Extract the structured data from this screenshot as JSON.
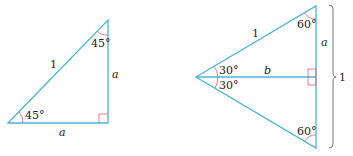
{
  "colors": {
    "line": "#4fb3d9",
    "angle_mark": "#d9607a",
    "brace": "#666666",
    "text": "#222222"
  },
  "left_triangle": {
    "hypotenuse_label": "1",
    "vertical_leg_label": "a",
    "horizontal_leg_label": "a",
    "top_angle": "45°",
    "bottom_angle": "45°"
  },
  "right_triangle": {
    "upper_side_label": "1",
    "upper_vertical_label": "a",
    "bisector_label": "b",
    "upper_left_angle": "30°",
    "lower_left_angle": "30°",
    "top_angle": "60°",
    "bottom_angle": "60°",
    "brace_label": "1"
  }
}
